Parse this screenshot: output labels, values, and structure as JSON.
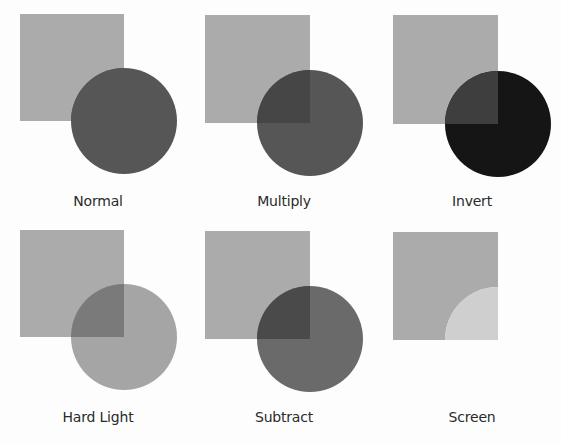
{
  "colors": {
    "background": "#fdfdfd",
    "square": "#ababab",
    "circle_normal": "#565656"
  },
  "panels": [
    {
      "label": "Normal",
      "mode": "normal",
      "sq": [
        20,
        14,
        104,
        107
      ],
      "circle": [
        124,
        121,
        53
      ],
      "circle_fill": "#565656",
      "overlap_fill": "#565656",
      "label_pos": [
        98,
        205
      ]
    },
    {
      "label": "Multiply",
      "mode": "multiply",
      "sq": [
        205,
        15,
        105,
        108
      ],
      "circle": [
        310,
        123,
        53
      ],
      "circle_fill": "#565656",
      "overlap_fill": "#464646",
      "label_pos": [
        284,
        205
      ]
    },
    {
      "label": "Invert",
      "mode": "invert",
      "sq": [
        393,
        15,
        105,
        109
      ],
      "circle": [
        498,
        124,
        53
      ],
      "circle_fill": "#151515",
      "overlap_fill": "#3e3e3e",
      "label_pos": [
        472,
        205
      ]
    },
    {
      "label": "Hard Light",
      "mode": "hard-light",
      "sq": [
        20,
        230,
        104,
        107
      ],
      "circle": [
        124,
        337,
        53
      ],
      "circle_fill": "#a5a5a5",
      "overlap_fill": "#7a7a7a",
      "label_pos": [
        98,
        421
      ]
    },
    {
      "label": "Subtract",
      "mode": "subtract",
      "sq": [
        205,
        231,
        105,
        108
      ],
      "circle": [
        310,
        339,
        53
      ],
      "circle_fill": "#6a6a6a",
      "overlap_fill": "#4a4a4a",
      "label_pos": [
        284,
        421
      ]
    },
    {
      "label": "Screen",
      "mode": "screen",
      "sq": [
        393,
        232,
        105,
        108
      ],
      "circle": [
        498,
        340,
        53
      ],
      "circle_fill": "#fdfdfd",
      "overlap_fill": "#cfcfcf",
      "label_pos": [
        472,
        421
      ]
    }
  ]
}
